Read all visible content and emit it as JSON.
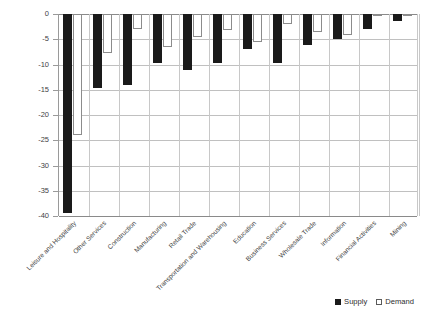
{
  "chart_data": {
    "type": "bar",
    "title": "",
    "subtitle": "",
    "xlabel": "",
    "ylabel": "",
    "ylim": [
      -40,
      0
    ],
    "ytick_values": [
      0,
      -5,
      -10,
      -15,
      -20,
      -25,
      -30,
      -35,
      -40
    ],
    "ytick_labels": [
      "0",
      "-5",
      "-10",
      "-15",
      "-20",
      "-25",
      "-30",
      "-35",
      "-40"
    ],
    "grid": true,
    "legend_position": "bottom-right",
    "categories": [
      "Leisure and Hospitality",
      "Other Services",
      "Construction",
      "Manufacturing",
      "Retail Trade",
      "Transportation and Warehousing",
      "Education",
      "Business Services",
      "Wholesale Trade",
      "Information",
      "Financial Activities",
      "Mining"
    ],
    "series": [
      {
        "name": "Supply",
        "color": "#1a1a1a",
        "values": [
          -39.5,
          -14.6,
          -14.1,
          -9.7,
          -11.1,
          -9.7,
          -7.0,
          -9.7,
          -6.1,
          -4.9,
          -3.0,
          -1.4
        ]
      },
      {
        "name": "Demand",
        "color": "#ffffff",
        "values": [
          -24.0,
          -7.8,
          -3.0,
          -6.5,
          -4.6,
          -3.1,
          -5.5,
          -2.0,
          -3.6,
          -4.2,
          -0.4,
          -0.3
        ]
      }
    ]
  },
  "legend": {
    "items": [
      {
        "label": "Supply",
        "swatch": "filled-square-icon"
      },
      {
        "label": "Demand",
        "swatch": "outlined-square-icon"
      }
    ]
  }
}
